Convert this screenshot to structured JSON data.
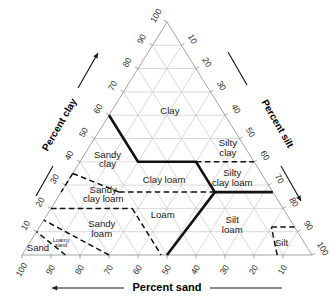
{
  "figure": {
    "type": "ternary-diagram"
  },
  "axes": {
    "left": {
      "label": "Percent clay",
      "ticks": [
        "10",
        "20",
        "30",
        "40",
        "50",
        "60",
        "70",
        "80",
        "90",
        "100"
      ],
      "arrow_direction": "up-right",
      "guide_line": true
    },
    "right": {
      "label": "Percent silt",
      "ticks": [
        "10",
        "20",
        "30",
        "40",
        "50",
        "60",
        "70",
        "80",
        "90",
        "100"
      ],
      "arrow_direction": "down-right",
      "guide_line": true
    },
    "bottom": {
      "label": "Percent sand",
      "ticks": [
        "100",
        "90",
        "80",
        "70",
        "60",
        "50",
        "40",
        "30",
        "20",
        "10"
      ],
      "arrow_direction": "left",
      "guide_line": true
    }
  },
  "colors": {
    "grid": "#c9c9c9",
    "outline": "#9a9a9a",
    "boundary_solid": "#111111",
    "boundary_dashed": "#111111",
    "text": "#1a1a1a",
    "background": "#ffffff"
  },
  "chart_data": {
    "type": "ternary",
    "components": [
      "clay",
      "silt",
      "sand"
    ],
    "axis_titles": {
      "left": "Percent clay",
      "right": "Percent silt",
      "bottom": "Percent sand"
    },
    "axis_range": [
      0,
      100
    ],
    "tick_step": 10,
    "grid": true,
    "legend": "none",
    "regions": [
      {
        "name": "Clay",
        "label_lines": [
          "Clay"
        ],
        "label_at": {
          "clay": 62,
          "silt": 20,
          "sand": 18
        },
        "size": "normal"
      },
      {
        "name": "Silty clay",
        "label_lines": [
          "Silty",
          "clay"
        ],
        "label_at": {
          "clay": 46,
          "silt": 48,
          "sand": 6
        },
        "size": "normal"
      },
      {
        "name": "Sandy clay",
        "label_lines": [
          "Sandy",
          "clay"
        ],
        "label_at": {
          "clay": 41,
          "silt": 9,
          "sand": 50
        },
        "size": "normal"
      },
      {
        "name": "Clay loam",
        "label_lines": [
          "Clay loam"
        ],
        "label_at": {
          "clay": 32,
          "silt": 33,
          "sand": 35
        },
        "size": "normal"
      },
      {
        "name": "Silty clay loam",
        "label_lines": [
          "Silty",
          "clay loam"
        ],
        "label_at": {
          "clay": 33,
          "silt": 56,
          "sand": 11
        },
        "size": "normal"
      },
      {
        "name": "Sandy clay loam",
        "label_lines": [
          "Sandy",
          "clay loam"
        ],
        "label_at": {
          "clay": 26,
          "silt": 15,
          "sand": 59
        },
        "size": "normal"
      },
      {
        "name": "Loam",
        "label_lines": [
          "Loam"
        ],
        "label_at": {
          "clay": 17,
          "silt": 40,
          "sand": 43
        },
        "size": "normal"
      },
      {
        "name": "Silt loam",
        "label_lines": [
          "Silt",
          "loam"
        ],
        "label_at": {
          "clay": 13,
          "silt": 66,
          "sand": 21
        },
        "size": "normal"
      },
      {
        "name": "Silt",
        "label_lines": [
          "Silt"
        ],
        "label_at": {
          "clay": 5,
          "silt": 87,
          "sand": 8
        },
        "size": "normal"
      },
      {
        "name": "Sandy loam",
        "label_lines": [
          "Sandy",
          "loam"
        ],
        "label_at": {
          "clay": 11,
          "silt": 22,
          "sand": 67
        },
        "size": "normal"
      },
      {
        "name": "Loamy sand",
        "label_lines": [
          "Loamy",
          "sand"
        ],
        "label_at": {
          "clay": 5,
          "silt": 11,
          "sand": 84
        },
        "size": "small"
      },
      {
        "name": "Sand",
        "label_lines": [
          "Sand"
        ],
        "label_at": {
          "clay": 3,
          "silt": 4,
          "sand": 93
        },
        "size": "normal"
      }
    ],
    "boundaries_solid": [
      [
        {
          "clay": 60,
          "silt": 0,
          "sand": 40
        },
        {
          "clay": 40,
          "silt": 20,
          "sand": 40
        },
        {
          "clay": 40,
          "silt": 40,
          "sand": 20
        },
        {
          "clay": 27,
          "silt": 53,
          "sand": 20
        },
        {
          "clay": 27,
          "silt": 73,
          "sand": 0
        }
      ],
      [
        {
          "clay": 27,
          "silt": 53,
          "sand": 20
        },
        {
          "clay": 0,
          "silt": 50,
          "sand": 50
        }
      ]
    ],
    "boundaries_dashed": [
      [
        {
          "clay": 40,
          "silt": 40,
          "sand": 20
        },
        {
          "clay": 40,
          "silt": 60,
          "sand": 0
        }
      ],
      [
        {
          "clay": 35,
          "silt": 0,
          "sand": 65
        },
        {
          "clay": 27,
          "silt": 0,
          "sand": 73
        }
      ],
      [
        {
          "clay": 35,
          "silt": 0,
          "sand": 65
        },
        {
          "clay": 27,
          "silt": 20,
          "sand": 53
        }
      ],
      [
        {
          "clay": 27,
          "silt": 20,
          "sand": 53
        },
        {
          "clay": 27,
          "silt": 45,
          "sand": 28
        }
      ],
      [
        {
          "clay": 27,
          "silt": 45,
          "sand": 28
        },
        {
          "clay": 27,
          "silt": 53,
          "sand": 20
        }
      ],
      [
        {
          "clay": 20,
          "silt": 0,
          "sand": 80
        },
        {
          "clay": 20,
          "silt": 28,
          "sand": 52
        }
      ],
      [
        {
          "clay": 20,
          "silt": 28,
          "sand": 52
        },
        {
          "clay": 7,
          "silt": 41,
          "sand": 52
        }
      ],
      [
        {
          "clay": 7,
          "silt": 41,
          "sand": 52
        },
        {
          "clay": 0,
          "silt": 48,
          "sand": 52
        }
      ],
      [
        {
          "clay": 0,
          "silt": 88,
          "sand": 12
        },
        {
          "clay": 12,
          "silt": 80,
          "sand": 8
        }
      ],
      [
        {
          "clay": 12,
          "silt": 80,
          "sand": 8
        },
        {
          "clay": 12,
          "silt": 88,
          "sand": 0
        }
      ],
      [
        {
          "clay": 0,
          "silt": 15,
          "sand": 85
        },
        {
          "clay": 10,
          "silt": 0,
          "sand": 90
        }
      ],
      [
        {
          "clay": 0,
          "silt": 30,
          "sand": 70
        },
        {
          "clay": 15,
          "silt": 0,
          "sand": 85
        }
      ]
    ]
  }
}
